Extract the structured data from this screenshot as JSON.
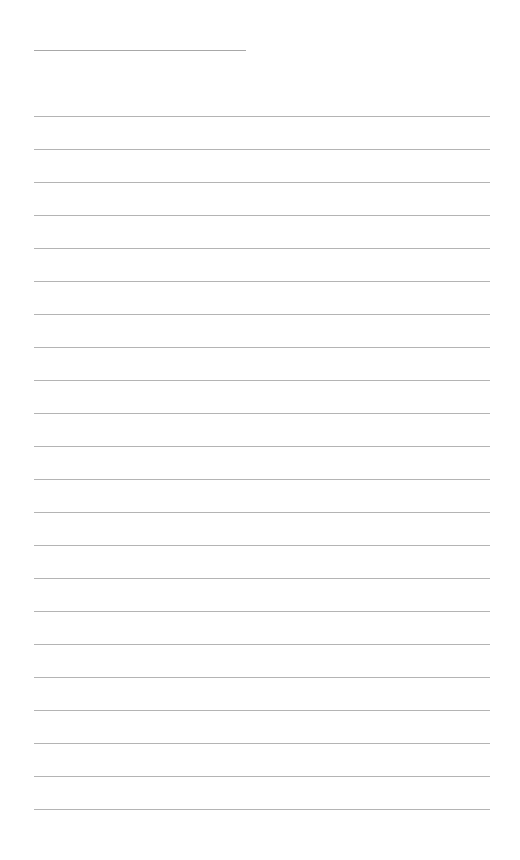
{
  "document": {
    "type": "lined-writing-page",
    "header_line": {
      "x": 34,
      "y": 50,
      "width": 212,
      "color": "#a8a8a8"
    },
    "ruled_lines": {
      "count": 22,
      "start_y": 116,
      "spacing": 33,
      "x": 34,
      "width": 456,
      "color": "#b4b4b4"
    },
    "background_color": "#ffffff"
  }
}
